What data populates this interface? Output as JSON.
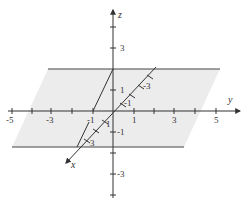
{
  "figure": {
    "type": "3d-coordinate-diagram",
    "axes": {
      "x": {
        "label": "x",
        "ticks": [
          "-3",
          "-1",
          "1",
          "3"
        ]
      },
      "y": {
        "label": "y",
        "ticks": [
          "-5",
          "-3",
          "-1",
          "1",
          "3",
          "5"
        ]
      },
      "z": {
        "label": "z",
        "ticks": [
          "3",
          "1",
          "-1",
          "-3"
        ]
      }
    },
    "labels": {
      "x_axis": "x",
      "y_axis": "y",
      "z_axis": "z",
      "y_neg5": "-5",
      "y_neg3": "-3",
      "y_neg1": "-1",
      "y_pos1": "1",
      "y_pos3": "3",
      "y_pos5": "5",
      "z_pos3": "3",
      "z_pos1": "1",
      "z_neg1": "-1",
      "z_neg3": "-3",
      "x_neg3": "-3",
      "x_neg1": "-1",
      "x_pos1": "1",
      "x_pos3": "3"
    },
    "colors": {
      "plane_fill": "#ececec",
      "lines": "#333333"
    }
  }
}
